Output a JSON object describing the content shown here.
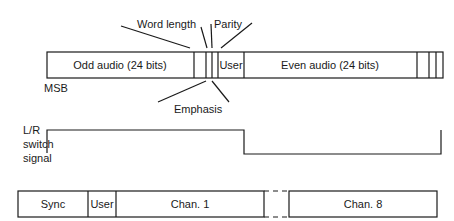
{
  "top_frame": {
    "odd_audio": "Odd audio (24 bits)",
    "user": "User",
    "even_audio": "Even audio (24 bits)",
    "msb": "MSB"
  },
  "callouts": {
    "word_length": "Word length",
    "parity": "Parity",
    "emphasis": "Emphasis"
  },
  "signal": {
    "line1": "L/R",
    "line2": "switch",
    "line3": "signal"
  },
  "bottom_frame": {
    "sync": "Sync",
    "user": "User",
    "chan1": "Chan. 1",
    "chan8": "Chan. 8"
  },
  "colors": {
    "stroke": "#1a1a1a",
    "background": "#ffffff"
  }
}
